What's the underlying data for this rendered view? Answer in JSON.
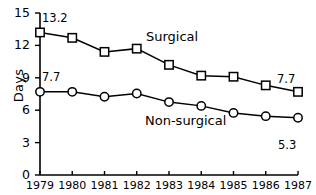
{
  "chart_data": {
    "type": "line",
    "title": "",
    "xlabel": "",
    "ylabel": "Days",
    "categories": [
      "1979",
      "1980",
      "1981",
      "1982",
      "1983",
      "1984",
      "1985",
      "1986",
      "1987"
    ],
    "xlim": [
      1979,
      1987
    ],
    "ylim": [
      0,
      15
    ],
    "yticks": [
      0,
      3,
      6,
      9,
      12,
      15
    ],
    "ytick_labels": [
      "0",
      "3",
      "6",
      "9",
      "12",
      "15"
    ],
    "grid": false,
    "legend_position": "inline-annotation",
    "series": [
      {
        "name": "Surgical",
        "marker": "square",
        "values": [
          13.2,
          12.7,
          11.4,
          11.7,
          10.2,
          9.2,
          9.1,
          8.3,
          7.7
        ]
      },
      {
        "name": "Non-surgical",
        "marker": "circle",
        "values": [
          7.7,
          7.7,
          7.25,
          7.55,
          6.75,
          6.4,
          5.75,
          5.45,
          5.3
        ]
      }
    ],
    "annotations": [
      {
        "text": "13.2",
        "series": "Surgical",
        "point": "1979",
        "position": "above-right"
      },
      {
        "text": "7.7",
        "series": "Surgical",
        "point": "1987",
        "position": "above-right"
      },
      {
        "text": "7.7",
        "series": "Non-surgical",
        "point": "1979",
        "position": "above-right"
      },
      {
        "text": "5.3",
        "series": "Non-surgical",
        "point": "1987",
        "position": "below-right"
      },
      {
        "text": "Surgical",
        "series": "Surgical",
        "position": "inline"
      },
      {
        "text": "Non-surgical",
        "series": "Non-surgical",
        "position": "inline"
      }
    ],
    "colors": {
      "line": "#000000",
      "marker_fill": "#ffffff",
      "axis": "#000000",
      "background": "#ffffff"
    }
  }
}
